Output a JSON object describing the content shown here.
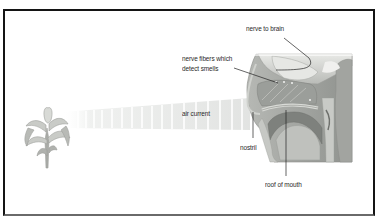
{
  "diagram": {
    "labels": {
      "nerve_to_brain": "nerve to brain",
      "nerve_fibers_line1": "nerve fibers which",
      "nerve_fibers_line2": "detect smells",
      "air_current": "air current",
      "nostril": "nostril",
      "roof_of_mouth": "roof of mouth"
    },
    "colors": {
      "border": "#141414",
      "text": "#2a2a2a",
      "leader_line": "#222222",
      "tissue": "#a8aaa6",
      "tissue_dark": "#7d807c",
      "tissue_light": "#d4d6d2",
      "air_stripe": "#e2e4e2"
    },
    "elements": [
      "flower",
      "air-current",
      "head-cross-section"
    ]
  }
}
